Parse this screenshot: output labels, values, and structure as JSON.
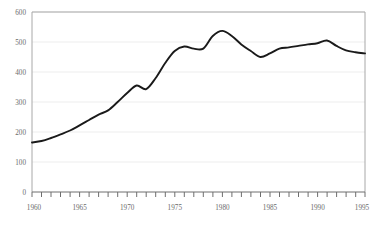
{
  "chart_data": {
    "type": "line",
    "title": "",
    "subtitle": "",
    "xlabel": "",
    "ylabel": "",
    "xlim": [
      1960,
      1995
    ],
    "ylim": [
      0,
      600
    ],
    "grid": true,
    "legend": null,
    "y_ticks": [
      0,
      100,
      200,
      300,
      400,
      500,
      600
    ],
    "y_tick_labels": [
      "0",
      "100",
      "200",
      "300",
      "400",
      "500",
      "600"
    ],
    "x_ticks": [
      1960,
      1965,
      1970,
      1975,
      1980,
      1985,
      1990,
      1995
    ],
    "x_tick_labels": [
      "1960",
      "1965",
      "1970",
      "1975",
      "1980",
      "1985",
      "1990",
      "1995"
    ],
    "x_minor_tick_interval": 1,
    "line_color": "#1a1a1a",
    "line_width": 1.9,
    "grid_color": "#ededed",
    "frame_color": "#9a9a9a",
    "x": [
      1960,
      1961,
      1962,
      1963,
      1964,
      1965,
      1966,
      1967,
      1968,
      1969,
      1970,
      1971,
      1972,
      1973,
      1974,
      1975,
      1976,
      1977,
      1978,
      1979,
      1980,
      1981,
      1982,
      1983,
      1984,
      1985,
      1986,
      1987,
      1988,
      1989,
      1990,
      1991,
      1992,
      1993,
      1994,
      1995
    ],
    "values": [
      165,
      170,
      180,
      192,
      205,
      222,
      240,
      258,
      272,
      300,
      330,
      355,
      343,
      380,
      430,
      470,
      485,
      478,
      478,
      520,
      537,
      520,
      492,
      470,
      450,
      462,
      478,
      482,
      487,
      492,
      496,
      505,
      487,
      472,
      466,
      462
    ],
    "series": [
      {
        "name": "series-1",
        "values": [
          165,
          170,
          180,
          192,
          205,
          222,
          240,
          258,
          272,
          300,
          330,
          355,
          343,
          380,
          430,
          470,
          485,
          478,
          478,
          520,
          537,
          520,
          492,
          470,
          450,
          462,
          478,
          482,
          487,
          492,
          496,
          505,
          487,
          472,
          466,
          462
        ]
      }
    ]
  },
  "axes": {
    "y_labels": [
      "600",
      "500",
      "400",
      "300",
      "200",
      "100",
      "0"
    ],
    "x_labels": [
      "1960",
      "1965",
      "1970",
      "1975",
      "1980",
      "1985",
      "1990",
      "1995"
    ]
  }
}
